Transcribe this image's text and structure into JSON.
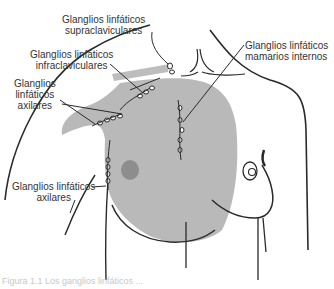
{
  "figure": {
    "type": "anatomical-illustration",
    "colors": {
      "line": "#2a2a2a",
      "shaded_region": "#b9b9b9",
      "nipple_area": "#8d8d8d",
      "background": "#ffffff",
      "text": "#333333"
    }
  },
  "labels": {
    "supraclavicular": {
      "line1": "Glanglios linfáticos",
      "line2": "supraclaviculares"
    },
    "infraclavicular": {
      "line1": "Glanglios linfáticos",
      "line2": "infraclaviculares"
    },
    "axillary_upper": {
      "line1": "Glanglios",
      "line2": "linfáticos",
      "line3": "axilares"
    },
    "internal_mammary": {
      "line1": "Glanglios linfáticos",
      "line2": "mamarios internos"
    },
    "axillary_lower": {
      "line1": "Glanglios linfáticos",
      "line2": "axilares"
    }
  },
  "caption": {
    "text": "Figura 1.1  Los ganglios linfáticos ..."
  }
}
